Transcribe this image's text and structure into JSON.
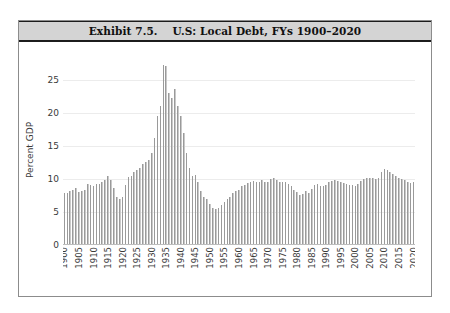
{
  "exhibit": {
    "title": "Exhibit 7.5.    U.S: Local Debt, FYs 1900–2020",
    "banner_bg": "#d4d4d4",
    "frame_color": "#8c8c8c",
    "bar_color": "#c9c9c9",
    "bar_edge_color": "#9a9a9a"
  },
  "chart_data": {
    "type": "bar",
    "title": "Exhibit 7.5.    U.S: Local Debt, FYs 1900–2020",
    "xlabel": "",
    "ylabel": "Percent GDP",
    "ylim": [
      0,
      28
    ],
    "yticks": [
      0,
      5,
      10,
      15,
      20,
      25
    ],
    "ytick_labels": [
      "0",
      "5",
      "10",
      "15",
      "20",
      "25"
    ],
    "xtick_labels": [
      "1900",
      "1905",
      "1910",
      "1915",
      "1920",
      "1925",
      "1930",
      "1935",
      "1940",
      "1945",
      "1950",
      "1955",
      "1960",
      "1965",
      "1970",
      "1975",
      "1980",
      "1985",
      "1990",
      "1995",
      "2000",
      "2005",
      "2010",
      "2015",
      "2020"
    ],
    "xtick_years": [
      1900,
      1905,
      1910,
      1915,
      1920,
      1925,
      1930,
      1935,
      1940,
      1945,
      1950,
      1955,
      1960,
      1965,
      1970,
      1975,
      1980,
      1985,
      1990,
      1995,
      2000,
      2005,
      2010,
      2015,
      2020
    ],
    "grid": true,
    "legend": null,
    "categories": [
      1900,
      1901,
      1902,
      1903,
      1904,
      1905,
      1906,
      1907,
      1908,
      1909,
      1910,
      1911,
      1912,
      1913,
      1914,
      1915,
      1916,
      1917,
      1918,
      1919,
      1920,
      1921,
      1922,
      1923,
      1924,
      1925,
      1926,
      1927,
      1928,
      1929,
      1930,
      1931,
      1932,
      1933,
      1934,
      1935,
      1936,
      1937,
      1938,
      1939,
      1940,
      1941,
      1942,
      1943,
      1944,
      1945,
      1946,
      1947,
      1948,
      1949,
      1950,
      1951,
      1952,
      1953,
      1954,
      1955,
      1956,
      1957,
      1958,
      1959,
      1960,
      1961,
      1962,
      1963,
      1964,
      1965,
      1966,
      1967,
      1968,
      1969,
      1970,
      1971,
      1972,
      1973,
      1974,
      1975,
      1976,
      1977,
      1978,
      1979,
      1980,
      1981,
      1982,
      1983,
      1984,
      1985,
      1986,
      1987,
      1988,
      1989,
      1990,
      1991,
      1992,
      1993,
      1994,
      1995,
      1996,
      1997,
      1998,
      1999,
      2000,
      2001,
      2002,
      2003,
      2004,
      2005,
      2006,
      2007,
      2008,
      2009,
      2010,
      2011,
      2012,
      2013,
      2014,
      2015,
      2016,
      2017,
      2018,
      2019,
      2020
    ],
    "values": [
      7.8,
      7.9,
      8.1,
      8.3,
      8.6,
      8.0,
      8.1,
      8.4,
      9.2,
      9.1,
      8.9,
      9.2,
      9.3,
      9.5,
      9.9,
      10.4,
      9.8,
      8.6,
      7.3,
      7.0,
      7.2,
      9.1,
      10.3,
      10.5,
      11.0,
      11.3,
      11.6,
      12.3,
      12.6,
      12.9,
      13.9,
      16.2,
      19.6,
      21.0,
      27.3,
      27.1,
      23.0,
      22.3,
      23.6,
      21.0,
      19.6,
      17.0,
      14.0,
      11.7,
      10.4,
      10.6,
      9.5,
      8.2,
      7.3,
      7.0,
      6.2,
      5.6,
      5.4,
      5.6,
      6.0,
      6.5,
      6.9,
      7.2,
      7.8,
      8.1,
      8.4,
      8.9,
      9.1,
      9.4,
      9.6,
      9.7,
      9.5,
      9.6,
      9.9,
      9.6,
      9.6,
      10.0,
      10.2,
      9.9,
      9.6,
      9.6,
      9.6,
      9.3,
      9.0,
      8.4,
      8.0,
      7.6,
      7.7,
      8.1,
      7.9,
      8.5,
      9.1,
      9.2,
      9.0,
      9.0,
      9.1,
      9.5,
      9.7,
      9.9,
      9.7,
      9.6,
      9.4,
      9.2,
      9.1,
      9.1,
      9.0,
      9.2,
      9.7,
      10.0,
      10.1,
      10.1,
      10.1,
      10.0,
      10.2,
      11.1,
      11.5,
      11.4,
      11.1,
      10.7,
      10.4,
      10.2,
      10.0,
      9.8,
      9.6,
      9.4,
      9.6
    ]
  }
}
